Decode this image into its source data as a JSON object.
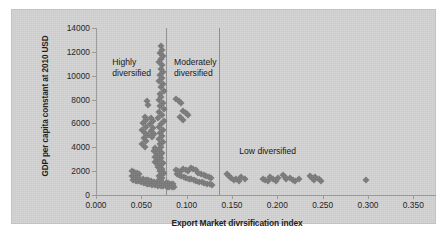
{
  "chart_data": {
    "type": "scatter",
    "title": "",
    "xlabel": "Export Market divrsification index",
    "ylabel": "GDP per capita constant at 2010 USD",
    "xlim": [
      0.0,
      0.375
    ],
    "ylim": [
      0,
      14000
    ],
    "xticks": [
      "0.000",
      "0.050",
      "0.100",
      "0.150",
      "0.200",
      "0.250",
      "0.300",
      "0.350"
    ],
    "xtick_values": [
      0.0,
      0.05,
      0.1,
      0.15,
      0.2,
      0.25,
      0.3,
      0.35
    ],
    "yticks": [
      "0",
      "2000",
      "4000",
      "6000",
      "8000",
      "10000",
      "12000",
      "14000"
    ],
    "ytick_values": [
      0,
      2000,
      4000,
      6000,
      8000,
      10000,
      12000,
      14000
    ],
    "grid": false,
    "legend": "none",
    "marker": "diamond",
    "marker_color": "#7b7b7b",
    "plot_background": "#d3d3d3",
    "annotations": [
      {
        "text": "Highly\ndiversified",
        "x": 0.018,
        "y": 11600
      },
      {
        "text": "Moderately\ndiversified",
        "x": 0.086,
        "y": 11600
      },
      {
        "text": "Low diversified",
        "x": 0.158,
        "y": 4100
      }
    ],
    "divider_lines": [
      0.0775,
      0.1355
    ],
    "points": [
      [
        0.0712,
        12450
      ],
      [
        0.0727,
        12180
      ],
      [
        0.0705,
        11930
      ],
      [
        0.0736,
        11680
      ],
      [
        0.0718,
        11400
      ],
      [
        0.07,
        11120
      ],
      [
        0.073,
        10870
      ],
      [
        0.0713,
        10600
      ],
      [
        0.0742,
        10330
      ],
      [
        0.0708,
        10060
      ],
      [
        0.0726,
        9800
      ],
      [
        0.07,
        9540
      ],
      [
        0.0735,
        9290
      ],
      [
        0.0714,
        9020
      ],
      [
        0.0745,
        8760
      ],
      [
        0.0704,
        8500
      ],
      [
        0.0722,
        8240
      ],
      [
        0.069,
        7980
      ],
      [
        0.0738,
        7720
      ],
      [
        0.071,
        7460
      ],
      [
        0.0752,
        7200
      ],
      [
        0.07,
        6960
      ],
      [
        0.0729,
        6700
      ],
      [
        0.0684,
        6460
      ],
      [
        0.0745,
        6200
      ],
      [
        0.0715,
        5960
      ],
      [
        0.0698,
        5700
      ],
      [
        0.0736,
        5460
      ],
      [
        0.0708,
        5200
      ],
      [
        0.0724,
        4960
      ],
      [
        0.069,
        4720
      ],
      [
        0.0742,
        4480
      ],
      [
        0.0705,
        4240
      ],
      [
        0.0718,
        4000
      ],
      [
        0.0694,
        3780
      ],
      [
        0.0731,
        3560
      ],
      [
        0.0709,
        3340
      ],
      [
        0.0722,
        3120
      ],
      [
        0.07,
        2900
      ],
      [
        0.074,
        2700
      ],
      [
        0.0714,
        2500
      ],
      [
        0.0686,
        2320
      ],
      [
        0.0728,
        2140
      ],
      [
        0.0705,
        1980
      ],
      [
        0.0745,
        1840
      ],
      [
        0.0716,
        1700
      ],
      [
        0.0696,
        1560
      ],
      [
        0.0733,
        1430
      ],
      [
        0.0708,
        1300
      ],
      [
        0.0721,
        1180
      ],
      [
        0.069,
        1060
      ],
      [
        0.0738,
        950
      ],
      [
        0.056,
        7850
      ],
      [
        0.057,
        7580
      ],
      [
        0.0538,
        6520
      ],
      [
        0.0556,
        6280
      ],
      [
        0.052,
        6000
      ],
      [
        0.0548,
        5740
      ],
      [
        0.0512,
        5480
      ],
      [
        0.054,
        5220
      ],
      [
        0.057,
        5000
      ],
      [
        0.0528,
        4760
      ],
      [
        0.0556,
        4520
      ],
      [
        0.0505,
        4280
      ],
      [
        0.0545,
        4060
      ],
      [
        0.0612,
        6480
      ],
      [
        0.0628,
        6200
      ],
      [
        0.06,
        5920
      ],
      [
        0.0634,
        5650
      ],
      [
        0.0608,
        5380
      ],
      [
        0.064,
        5120
      ],
      [
        0.0618,
        4860
      ],
      [
        0.0655,
        3920
      ],
      [
        0.064,
        3680
      ],
      [
        0.0668,
        3460
      ],
      [
        0.0646,
        3220
      ],
      [
        0.0672,
        2980
      ],
      [
        0.0652,
        2760
      ],
      [
        0.068,
        2540
      ],
      [
        0.0395,
        2050
      ],
      [
        0.042,
        1920
      ],
      [
        0.0448,
        1820
      ],
      [
        0.047,
        1740
      ],
      [
        0.0398,
        1600
      ],
      [
        0.0428,
        1520
      ],
      [
        0.0456,
        1440
      ],
      [
        0.0484,
        1380
      ],
      [
        0.0412,
        1290
      ],
      [
        0.044,
        1210
      ],
      [
        0.0468,
        1140
      ],
      [
        0.0496,
        1080
      ],
      [
        0.052,
        1340
      ],
      [
        0.0548,
        1280
      ],
      [
        0.0576,
        1220
      ],
      [
        0.0604,
        1180
      ],
      [
        0.0532,
        1020
      ],
      [
        0.056,
        960
      ],
      [
        0.0588,
        910
      ],
      [
        0.0616,
        870
      ],
      [
        0.0644,
        1130
      ],
      [
        0.0672,
        1090
      ],
      [
        0.07,
        1050
      ],
      [
        0.0728,
        1010
      ],
      [
        0.0656,
        830
      ],
      [
        0.0684,
        790
      ],
      [
        0.0712,
        760
      ],
      [
        0.074,
        730
      ],
      [
        0.0768,
        1000
      ],
      [
        0.0796,
        980
      ],
      [
        0.0824,
        950
      ],
      [
        0.0852,
        920
      ],
      [
        0.078,
        700
      ],
      [
        0.0808,
        680
      ],
      [
        0.0836,
        660
      ],
      [
        0.0864,
        640
      ],
      [
        0.088,
        2120
      ],
      [
        0.0905,
        2000
      ],
      [
        0.093,
        1900
      ],
      [
        0.0888,
        1720
      ],
      [
        0.0915,
        1640
      ],
      [
        0.0942,
        1560
      ],
      [
        0.096,
        2180
      ],
      [
        0.0988,
        2080
      ],
      [
        0.1016,
        1980
      ],
      [
        0.0968,
        1500
      ],
      [
        0.0996,
        1440
      ],
      [
        0.1024,
        1380
      ],
      [
        0.1044,
        2280
      ],
      [
        0.1072,
        2160
      ],
      [
        0.11,
        2060
      ],
      [
        0.1052,
        1320
      ],
      [
        0.108,
        1260
      ],
      [
        0.1108,
        1200
      ],
      [
        0.113,
        1860
      ],
      [
        0.1158,
        1760
      ],
      [
        0.1186,
        1680
      ],
      [
        0.114,
        1120
      ],
      [
        0.1168,
        1060
      ],
      [
        0.1196,
        1000
      ],
      [
        0.1216,
        1560
      ],
      [
        0.1244,
        1480
      ],
      [
        0.1272,
        1400
      ],
      [
        0.1224,
        940
      ],
      [
        0.1252,
        900
      ],
      [
        0.128,
        860
      ],
      [
        0.0885,
        8060
      ],
      [
        0.0912,
        7880
      ],
      [
        0.094,
        7700
      ],
      [
        0.096,
        7080
      ],
      [
        0.0988,
        6880
      ],
      [
        0.1016,
        6700
      ],
      [
        0.093,
        6500
      ],
      [
        0.0958,
        6320
      ],
      [
        0.144,
        1720
      ],
      [
        0.1468,
        1560
      ],
      [
        0.1492,
        1400
      ],
      [
        0.152,
        1240
      ],
      [
        0.1548,
        1340
      ],
      [
        0.1576,
        1180
      ],
      [
        0.1604,
        1480
      ],
      [
        0.164,
        1320
      ],
      [
        0.184,
        1380
      ],
      [
        0.1868,
        1240
      ],
      [
        0.1896,
        1160
      ],
      [
        0.1924,
        1500
      ],
      [
        0.1952,
        1300
      ],
      [
        0.198,
        1200
      ],
      [
        0.201,
        1420
      ],
      [
        0.206,
        1680
      ],
      [
        0.208,
        1500
      ],
      [
        0.21,
        1320
      ],
      [
        0.214,
        1440
      ],
      [
        0.217,
        1280
      ],
      [
        0.22,
        1180
      ],
      [
        0.224,
        1380
      ],
      [
        0.236,
        1620
      ],
      [
        0.238,
        1440
      ],
      [
        0.24,
        1280
      ],
      [
        0.242,
        1520
      ],
      [
        0.246,
        1360
      ],
      [
        0.248,
        1200
      ],
      [
        0.298,
        1260
      ]
    ]
  }
}
